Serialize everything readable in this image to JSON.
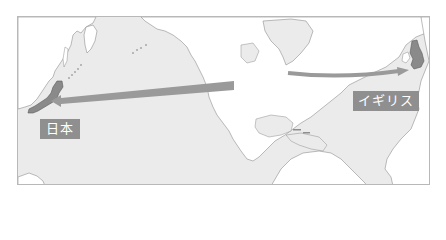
{
  "map": {
    "title": "",
    "ocean_color": "#ebebeb",
    "land_color": "#ffffff",
    "highlight_color": "#8a8a8a",
    "arrow_color": "#9a9a9a",
    "border_color": "#b8b8b8"
  },
  "labels": {
    "japan": "日本",
    "uk": "イギリス"
  },
  "arrows": [
    {
      "name": "north-america-to-japan",
      "from": "North America (west)",
      "to": "日本"
    },
    {
      "name": "north-america-to-uk",
      "from": "North America (east)",
      "to": "イギリス"
    }
  ]
}
